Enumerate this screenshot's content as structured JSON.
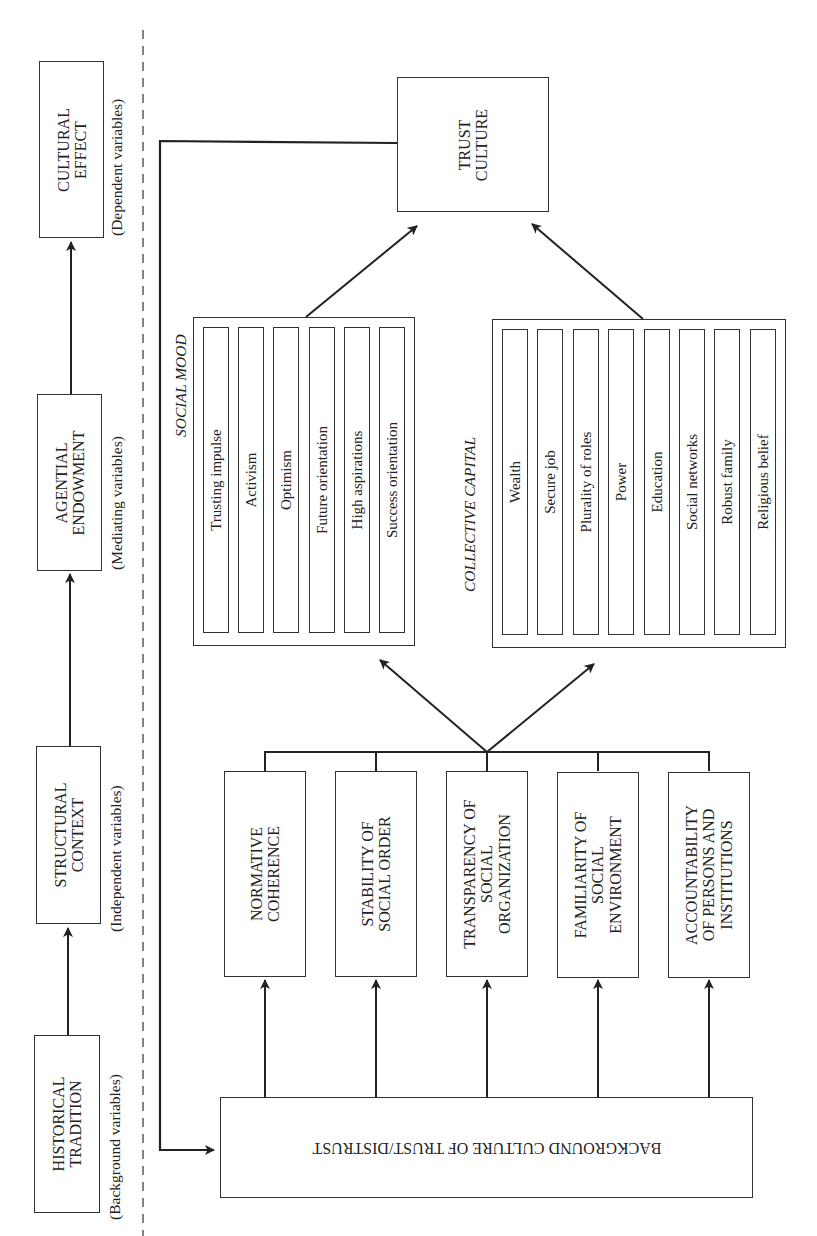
{
  "left_column": {
    "boxes": [
      {
        "id": "cultural-effect",
        "label": "CULTURAL\nEFFECT",
        "caption": "(Dependent variables)"
      },
      {
        "id": "agential-endowment",
        "label": "AGENTIAL\nENDOWMENT",
        "caption": "(Mediating variables)"
      },
      {
        "id": "structural-context",
        "label": "STRUCTURAL\nCONTEXT",
        "caption": "(Independent variables)"
      },
      {
        "id": "historical-tradition",
        "label": "HISTORICAL\nTRADITION",
        "caption": "(Background variables)"
      }
    ]
  },
  "trust_culture": {
    "label": "TRUST\nCULTURE"
  },
  "social_mood": {
    "title": "SOCIAL MOOD",
    "items": [
      "Trusting impulse",
      "Activism",
      "Optimism",
      "Future orientation",
      "High aspirations",
      "Success orientation"
    ]
  },
  "collective_capital": {
    "title": "COLLECTIVE CAPITAL",
    "items": [
      "Wealth",
      "Secure job",
      "Plurality of roles",
      "Power",
      "Education",
      "Social networks",
      "Robust family",
      "Religious belief"
    ]
  },
  "structural_factors": [
    {
      "label": "NORMATIVE\nCOHERENCE"
    },
    {
      "label": "STABILITY OF\nSOCIAL ORDER"
    },
    {
      "label": "TRANSPARENCY OF\nSOCIAL\nORGANIZATION"
    },
    {
      "label": "FAMILIARITY OF\nSOCIAL\nENVIRONMENT"
    },
    {
      "label": "ACCOUNTABILITY\nOF PERSONS AND\nINSTITUTIONS"
    }
  ],
  "background_culture": {
    "label": "BACKGROUND CULTURE OF TRUST/DISTRUST"
  },
  "colors": {
    "line": "#222222",
    "background": "#ffffff",
    "text": "#222222"
  }
}
